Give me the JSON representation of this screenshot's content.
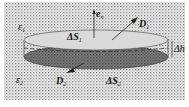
{
  "diagram": {
    "type": "pillbox Gaussian surface at dielectric interface",
    "labels": {
      "eps1": "ε",
      "eps1_sub": "1",
      "eps2": "ε",
      "eps2_sub": "2",
      "en": "e",
      "en_sub": "n",
      "D1": "D",
      "D1_sub": "1",
      "D2": "D",
      "D2_sub": "2",
      "dS1": "ΔS",
      "dS1_sub": "1",
      "dS2": "ΔS",
      "dS2_sub": "2",
      "dh": "Δh"
    },
    "colors": {
      "background_texture": "#c8c8c8",
      "top_face": "#dcdcdc",
      "bottom_face": "#6e6e6e",
      "lines": "#222222"
    }
  }
}
